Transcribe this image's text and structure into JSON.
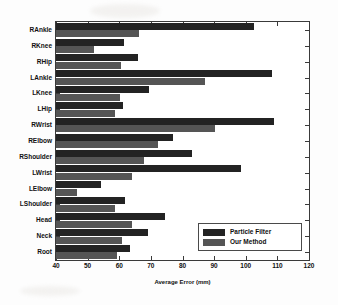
{
  "figure": {
    "background_color": "#fdfdfd",
    "axes_color": "#3a3a3a"
  },
  "chart_data": {
    "type": "bar",
    "orientation": "horizontal",
    "title": "",
    "xlabel": "Average Error (mm)",
    "ylabel": "",
    "xlim": [
      40,
      120
    ],
    "ylim": [
      0,
      15
    ],
    "grid": false,
    "xticks": [
      40,
      50,
      60,
      70,
      80,
      90,
      100,
      110,
      120
    ],
    "xticklabels": [
      "40",
      "50",
      "60",
      "70",
      "80",
      "90",
      "100",
      "110",
      "120"
    ],
    "categories": [
      "RAnkle",
      "RKnee",
      "RHip",
      "LAnkle",
      "LKnee",
      "LHip",
      "RWrist",
      "RElbow",
      "RShoulder",
      "LWrist",
      "LElbow",
      "LShoulder",
      "Head",
      "Neck",
      "Root"
    ],
    "series": [
      {
        "name": "Particle Filter",
        "color": "#232323",
        "values": [
          102.7,
          61.6,
          66.0,
          108.4,
          69.5,
          61.3,
          109.0,
          77.0,
          82.9,
          98.6,
          54.1,
          61.9,
          74.5,
          69.1,
          63.5
        ]
      },
      {
        "name": "Our Method",
        "color": "#555555",
        "values": [
          66.3,
          51.9,
          60.4,
          87.0,
          60.1,
          58.5,
          90.2,
          72.3,
          67.9,
          64.1,
          46.5,
          58.8,
          64.1,
          61.0,
          59.4
        ]
      }
    ],
    "legend": {
      "position": "lower right",
      "entries": [
        "Particle Filter",
        "Our Method"
      ]
    }
  }
}
